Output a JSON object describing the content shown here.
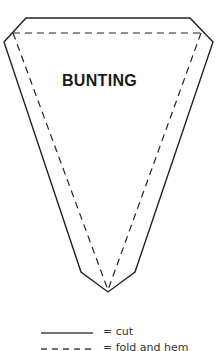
{
  "diagram": {
    "title": "BUNTING",
    "outline_color": "#222222",
    "cut_path": [
      [
        26,
        18
      ],
      [
        190,
        18
      ],
      [
        213,
        42
      ],
      [
        135,
        272
      ],
      [
        108,
        292
      ],
      [
        81,
        272
      ],
      [
        4,
        42
      ]
    ],
    "fold_lines": [
      [
        [
          13,
          33
        ],
        [
          201,
          33
        ]
      ],
      [
        [
          13,
          33
        ],
        [
          108,
          290
        ]
      ],
      [
        [
          201,
          33
        ],
        [
          108,
          290
        ]
      ]
    ]
  },
  "legend": {
    "items": [
      {
        "style": "solid",
        "label": "= cut"
      },
      {
        "style": "dashed",
        "label": "= fold and hem"
      }
    ]
  }
}
